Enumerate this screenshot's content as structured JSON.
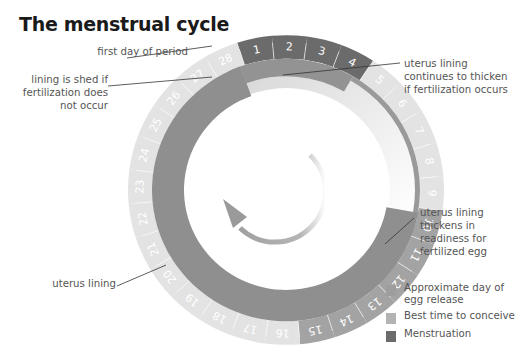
{
  "title": "The menstrual cycle",
  "colors": {
    "menstruation": "#6b6b6b",
    "best_time": "#a8a8a8",
    "egg_release": "#9a9a9a",
    "other_days": "#e2e2e2",
    "lining": "#8f8f8f",
    "thin_lining": "#d8d8d8",
    "arrow": "#a6a6a6"
  },
  "annotations": {
    "first_day": "first day of period",
    "shed": [
      "lining is shed if",
      "fertilization does",
      "not occur"
    ],
    "continues": [
      "uterus lining",
      "continues to thicken",
      "if fertilization occurs"
    ],
    "thickens": [
      "uterus lining",
      "thickens in",
      "readiness for",
      "fertilized egg"
    ],
    "uterus_lining": "uterus lining"
  },
  "legend": [
    {
      "label": "Approximate day of egg release",
      "line1": "Approximate day of",
      "line2": "egg release",
      "color": "#9e9e9e"
    },
    {
      "label": "Best time to conceive",
      "line1": "Best time to conceive",
      "color": "#b3b3b3"
    },
    {
      "label": "Menstruation",
      "line1": "Menstruation",
      "color": "#6b6b6b"
    }
  ],
  "chart_data": {
    "type": "cycle-diagram",
    "title": "The menstrual cycle",
    "days": [
      1,
      2,
      3,
      4,
      5,
      6,
      7,
      8,
      9,
      10,
      11,
      12,
      13,
      14,
      15,
      16,
      17,
      18,
      19,
      20,
      21,
      22,
      23,
      24,
      25,
      26,
      27,
      28
    ],
    "phases": [
      {
        "name": "Menstruation",
        "days": [
          1,
          2,
          3,
          4
        ]
      },
      {
        "name": "Best time to conceive",
        "days": [
          10,
          11,
          12,
          13,
          14,
          15
        ]
      },
      {
        "name": "Approximate day of egg release",
        "days": [
          14
        ]
      }
    ],
    "legend": [
      "Approximate day of egg release",
      "Best time to conceive",
      "Menstruation"
    ],
    "direction": "clockwise"
  }
}
